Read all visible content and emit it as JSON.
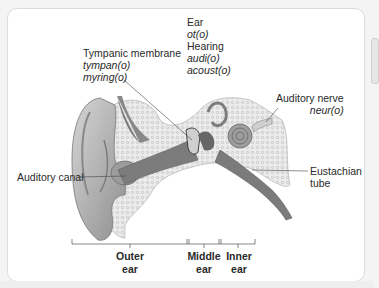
{
  "diagram": {
    "type": "anatomical-illustration",
    "labels": {
      "ear_terms": {
        "title_1": "Ear",
        "root_1": "ot(o)",
        "title_2": "Hearing",
        "root_2": "audi(o)",
        "root_3": "acoust(o)"
      },
      "tympanic_membrane": {
        "title": "Tympanic membrane",
        "root_1": "tympan(o)",
        "root_2": "myring(o)"
      },
      "auditory_nerve": {
        "title": "Auditory nerve",
        "root": "neur(o)"
      },
      "auditory_canal": {
        "title": "Auditory canal"
      },
      "eustachian_tube": {
        "line_1": "Eustachian",
        "line_2": "tube"
      }
    },
    "regions": [
      {
        "line_1": "Outer",
        "line_2": "ear"
      },
      {
        "line_1": "Middle",
        "line_2": "ear"
      },
      {
        "line_1": "Inner",
        "line_2": "ear"
      }
    ],
    "colors": {
      "tissue": "#9a9a9a",
      "dark_tissue": "#6e6e6e",
      "bone_fill": "#e9e9e9",
      "leader_line": "#444444"
    }
  }
}
